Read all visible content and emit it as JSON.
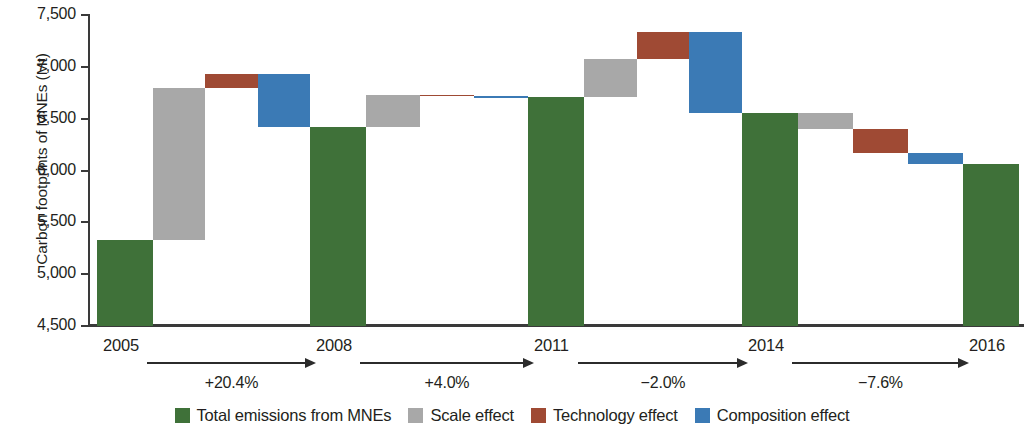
{
  "chart_data": {
    "type": "bar",
    "subtype": "waterfall",
    "title": "",
    "xlabel": "",
    "ylabel": "Carbon footprints of MNEs (Mt)",
    "ylim": [
      4500,
      7500
    ],
    "ytick_labels": [
      "7,500",
      "7,000",
      "6,500",
      "6,000",
      "5,500",
      "5,000",
      "4,500"
    ],
    "ytick_values": [
      7500,
      7000,
      6500,
      6000,
      5500,
      5000,
      4500
    ],
    "grid": false,
    "legend_position": "bottom",
    "categories": [
      "2005",
      "2008",
      "2011",
      "2014",
      "2016"
    ],
    "totals": [
      5330,
      6420,
      6710,
      6555,
      6060
    ],
    "legend": [
      {
        "label": "Total emissions from MNEs",
        "color": "#3f7139",
        "key": "total"
      },
      {
        "label": "Scale effect",
        "color": "#a8a8a8",
        "key": "scale"
      },
      {
        "label": "Technology effect",
        "color": "#9f4a34",
        "key": "technology"
      },
      {
        "label": "Composition effect",
        "color": "#3b7ab5",
        "key": "composition"
      }
    ],
    "transitions": [
      {
        "from": "2005",
        "to": "2008",
        "growth_label": "+20.4%",
        "start": 5330,
        "end": 6420,
        "steps": [
          {
            "key": "scale",
            "from": 5330,
            "to": 6800
          },
          {
            "key": "technology",
            "from": 6800,
            "to": 6930
          },
          {
            "key": "composition",
            "from": 6930,
            "to": 6420
          }
        ]
      },
      {
        "from": "2008",
        "to": "2011",
        "growth_label": "+4.0%",
        "start": 6420,
        "end": 6710,
        "steps": [
          {
            "key": "scale",
            "from": 6420,
            "to": 6730
          },
          {
            "key": "technology",
            "from": 6730,
            "to": 6715
          },
          {
            "key": "composition",
            "from": 6715,
            "to": 6710
          }
        ]
      },
      {
        "from": "2011",
        "to": "2014",
        "growth_label": "−2.0%",
        "start": 6710,
        "end": 6555,
        "steps": [
          {
            "key": "scale",
            "from": 6710,
            "to": 7075
          },
          {
            "key": "technology",
            "from": 7075,
            "to": 7335
          },
          {
            "key": "composition",
            "from": 7335,
            "to": 6555
          }
        ]
      },
      {
        "from": "2014",
        "to": "2016",
        "growth_label": "−7.6%",
        "start": 6555,
        "end": 6060,
        "steps": [
          {
            "key": "scale",
            "from": 6555,
            "to": 6405
          },
          {
            "key": "technology",
            "from": 6405,
            "to": 6165
          },
          {
            "key": "composition",
            "from": 6165,
            "to": 6060
          }
        ]
      }
    ]
  }
}
